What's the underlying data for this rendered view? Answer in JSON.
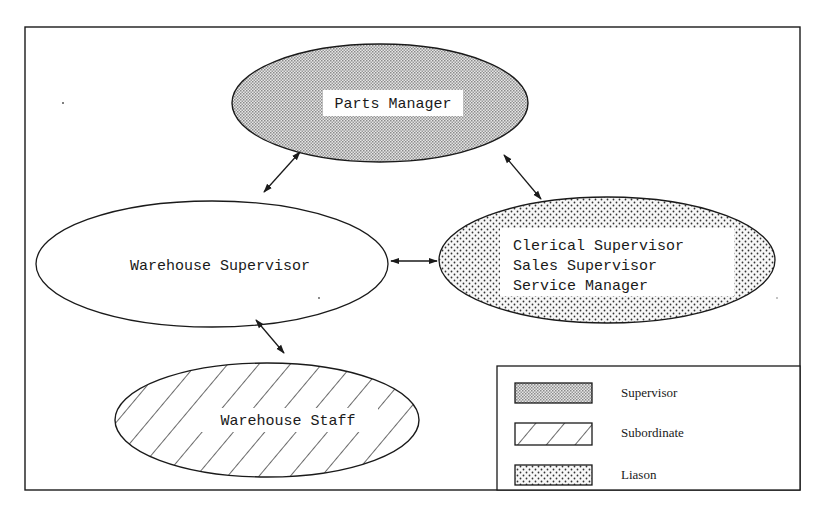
{
  "diagram": {
    "type": "organizational-communication-diagram",
    "colors": {
      "stroke": "#1a1a1a",
      "background": "#ffffff",
      "supervisor_fill": "#c8c8c8",
      "liason_dots": "#2a2a2a"
    },
    "nodes": [
      {
        "id": "parts-manager",
        "label": "Parts Manager",
        "role": "Supervisor"
      },
      {
        "id": "warehouse-supervisor",
        "label": "Warehouse Supervisor",
        "role": "None"
      },
      {
        "id": "liason-group",
        "lines": [
          "Clerical Supervisor",
          "Sales Supervisor",
          "Service Manager"
        ],
        "role": "Liason"
      },
      {
        "id": "warehouse-staff",
        "label": "Warehouse Staff",
        "role": "Subordinate"
      }
    ],
    "edges": [
      {
        "from": "parts-manager",
        "to": "warehouse-supervisor",
        "direction": "bidirectional"
      },
      {
        "from": "parts-manager",
        "to": "liason-group",
        "direction": "bidirectional"
      },
      {
        "from": "warehouse-supervisor",
        "to": "liason-group",
        "direction": "bidirectional"
      },
      {
        "from": "warehouse-supervisor",
        "to": "warehouse-staff",
        "direction": "bidirectional"
      }
    ],
    "legend": {
      "items": [
        {
          "label": "Supervisor",
          "pattern": "fine-gray-stipple"
        },
        {
          "label": "Subordinate",
          "pattern": "diagonal-hatch"
        },
        {
          "label": "Liason",
          "pattern": "dots"
        }
      ]
    }
  }
}
